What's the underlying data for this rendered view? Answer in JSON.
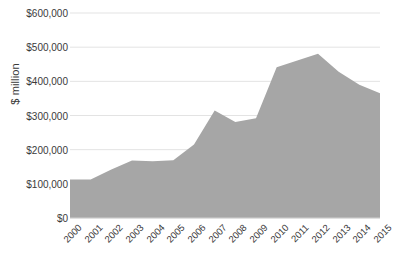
{
  "chart_data": {
    "type": "area",
    "title": "",
    "subtitle": "",
    "xlabel": "",
    "ylabel": "$ million",
    "categories": [
      "2000",
      "2001",
      "2002",
      "2003",
      "2004",
      "2005",
      "2006",
      "2007",
      "2008",
      "2009",
      "2010",
      "2011",
      "2012",
      "2013",
      "2014",
      "2015"
    ],
    "values": [
      113000,
      113000,
      142000,
      168000,
      166000,
      169000,
      215000,
      315000,
      281000,
      292000,
      441000,
      461000,
      481000,
      428000,
      390000,
      365000
    ],
    "series": [
      {
        "name": "",
        "values": [
          113000,
          113000,
          142000,
          168000,
          166000,
          169000,
          215000,
          315000,
          281000,
          292000,
          441000,
          461000,
          481000,
          428000,
          390000,
          365000
        ]
      }
    ],
    "ylim": [
      0,
      600000
    ],
    "ytick_values": [
      0,
      100000,
      200000,
      300000,
      400000,
      500000,
      600000
    ],
    "ytick_labels": [
      "$0",
      "$100,000",
      "$200,000",
      "$300,000",
      "$400,000",
      "$500,000",
      "$600,000"
    ],
    "xtick_labels": [
      "2000",
      "2001",
      "2002",
      "2003",
      "2004",
      "2005",
      "2006",
      "2007",
      "2008",
      "2009",
      "2010",
      "2011",
      "2012",
      "2013",
      "2014",
      "2015"
    ],
    "grid": "horizontal",
    "legend": "none",
    "colors": {
      "area_fill": "#a6a6a6",
      "gridline": "#e3e3e3",
      "axis_line": "#d0d0d0",
      "text": "#3a3a3a",
      "background": "#ffffff"
    }
  }
}
